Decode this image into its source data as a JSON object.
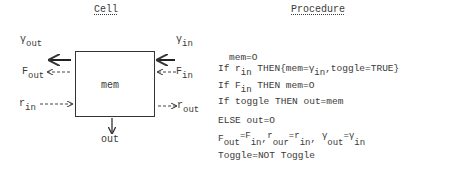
{
  "cell": {
    "heading": "Cell",
    "box_label": "mem",
    "labels": {
      "gamma_out": {
        "main": "γ",
        "sub": "out"
      },
      "gamma_in": {
        "main": "γ",
        "sub": "in"
      },
      "f_out": {
        "main": "F",
        "sub": "out"
      },
      "f_in": {
        "main": "F",
        "sub": "in"
      },
      "r_in": {
        "main": "r",
        "sub": "in"
      },
      "r_out": {
        "main": "r",
        "sub": "out"
      },
      "out": "out"
    }
  },
  "procedure": {
    "heading": "Procedure",
    "lines": [
      {
        "text": "mem=O"
      },
      {
        "pre": "If r",
        "sub": "in",
        "mid": " THEN{mem=γ",
        "sub2": "in",
        "post": ",toggle=TRUE}"
      },
      {
        "pre": "If F",
        "sub": "in",
        "post": " THEN mem=O"
      },
      {
        "text": "If toggle THEN out=mem"
      },
      {
        "text": "ELSE out=O"
      },
      {
        "assign": [
          {
            "a": "F",
            "as": "out",
            "b": "F",
            "bs": "in"
          },
          {
            "a": "r",
            "as": "our",
            "b": "r",
            "bs": "in"
          },
          {
            "a": "γ",
            "as": "out",
            "b": "γ",
            "bs": "in"
          }
        ]
      },
      {
        "text": "Toggle=NOT Toggle"
      }
    ]
  }
}
